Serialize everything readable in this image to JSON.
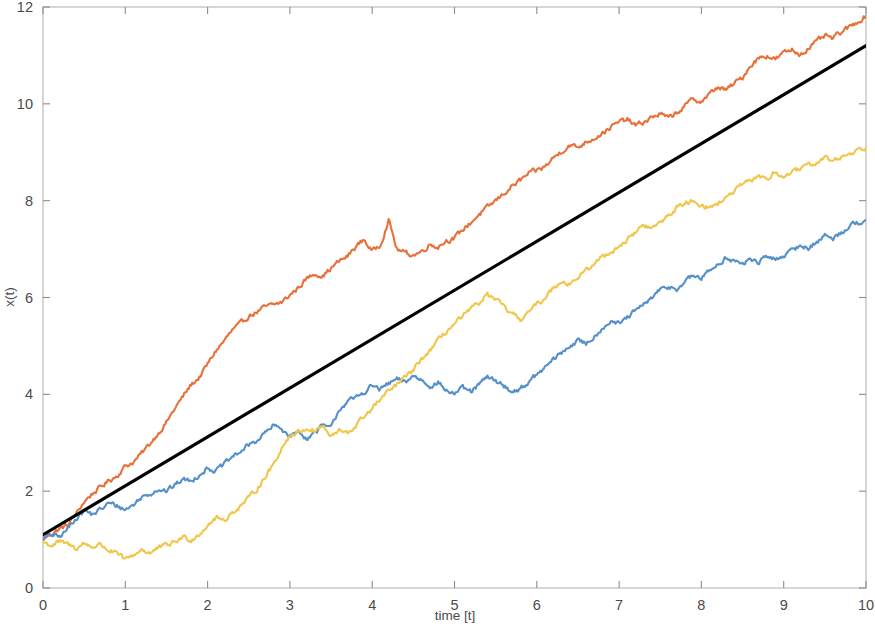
{
  "chart_data": {
    "type": "line",
    "title": "",
    "subtitle": "",
    "xlabel": "time [t]",
    "ylabel": "x(t)",
    "xlim": [
      0,
      10
    ],
    "ylim": [
      0,
      12
    ],
    "xticks": [
      0,
      1,
      2,
      3,
      4,
      5,
      6,
      7,
      8,
      9,
      10
    ],
    "yticks": [
      0,
      2,
      4,
      6,
      8,
      10,
      12
    ],
    "xtick_labels": [
      "0",
      "1",
      "2",
      "3",
      "4",
      "5",
      "6",
      "7",
      "8",
      "9",
      "10"
    ],
    "ytick_labels": [
      "0",
      "2",
      "4",
      "6",
      "8",
      "10",
      "12"
    ],
    "grid": false,
    "legend": null,
    "legend_position": "none",
    "background": "#ffffff",
    "frame_color": "#b4b4b4",
    "tick_color": "#8c8c8c",
    "label_color": "#4a4a4a",
    "annotations": [],
    "series": [
      {
        "name": "path-1-orange",
        "color": "#E8703A",
        "linewidth": 2.1,
        "style": "solid",
        "x": [
          0,
          0.1,
          0.2,
          0.3,
          0.4,
          0.5,
          0.6,
          0.7,
          0.8,
          0.9,
          1.0,
          1.1,
          1.2,
          1.3,
          1.4,
          1.5,
          1.6,
          1.7,
          1.8,
          1.9,
          2.0,
          2.1,
          2.2,
          2.3,
          2.4,
          2.5,
          2.6,
          2.7,
          2.8,
          2.9,
          3.0,
          3.1,
          3.2,
          3.3,
          3.4,
          3.5,
          3.6,
          3.7,
          3.8,
          3.9,
          4.0,
          4.1,
          4.2,
          4.3,
          4.4,
          4.5,
          4.6,
          4.7,
          4.8,
          4.9,
          5.0,
          5.1,
          5.2,
          5.3,
          5.4,
          5.5,
          5.6,
          5.7,
          5.8,
          5.9,
          6.0,
          6.1,
          6.2,
          6.3,
          6.4,
          6.5,
          6.6,
          6.7,
          6.8,
          6.9,
          7.0,
          7.1,
          7.2,
          7.3,
          7.4,
          7.5,
          7.6,
          7.7,
          7.8,
          7.9,
          8.0,
          8.1,
          8.2,
          8.3,
          8.4,
          8.5,
          8.6,
          8.7,
          8.8,
          8.9,
          9.0,
          9.1,
          9.2,
          9.3,
          9.4,
          9.5,
          9.6,
          9.7,
          9.8,
          9.9,
          10.0
        ],
        "y": [
          1.0,
          1.12,
          1.22,
          1.3,
          1.52,
          1.78,
          1.95,
          2.08,
          2.22,
          2.32,
          2.52,
          2.6,
          2.78,
          2.98,
          3.2,
          3.42,
          3.7,
          3.95,
          4.2,
          4.35,
          4.62,
          4.9,
          5.1,
          5.32,
          5.45,
          5.62,
          5.7,
          5.8,
          5.85,
          5.9,
          6.05,
          6.2,
          6.38,
          6.5,
          6.45,
          6.6,
          6.75,
          6.85,
          7.05,
          7.2,
          6.95,
          7.1,
          7.6,
          7.0,
          6.92,
          6.88,
          6.95,
          7.1,
          7.05,
          7.18,
          7.22,
          7.4,
          7.55,
          7.72,
          7.85,
          8.0,
          8.15,
          8.3,
          8.42,
          8.55,
          8.62,
          8.7,
          8.88,
          9.02,
          9.15,
          9.1,
          9.22,
          9.3,
          9.4,
          9.52,
          9.62,
          9.68,
          9.55,
          9.62,
          9.72,
          9.8,
          9.7,
          9.82,
          9.95,
          10.1,
          10.05,
          10.2,
          10.35,
          10.28,
          10.42,
          10.55,
          10.8,
          10.95,
          11.0,
          10.92,
          11.05,
          11.12,
          11.02,
          11.15,
          11.28,
          11.4,
          11.35,
          11.48,
          11.58,
          11.7,
          11.82
        ]
      },
      {
        "name": "path-2-blue",
        "color": "#5590C8",
        "linewidth": 2.1,
        "style": "solid",
        "x": [
          0,
          0.1,
          0.2,
          0.3,
          0.4,
          0.5,
          0.6,
          0.7,
          0.8,
          0.9,
          1.0,
          1.1,
          1.2,
          1.3,
          1.4,
          1.5,
          1.6,
          1.7,
          1.8,
          1.9,
          2.0,
          2.1,
          2.2,
          2.3,
          2.4,
          2.5,
          2.6,
          2.7,
          2.8,
          2.9,
          3.0,
          3.1,
          3.2,
          3.3,
          3.4,
          3.5,
          3.6,
          3.7,
          3.8,
          3.9,
          4.0,
          4.1,
          4.2,
          4.3,
          4.4,
          4.5,
          4.6,
          4.7,
          4.8,
          4.9,
          5.0,
          5.1,
          5.2,
          5.3,
          5.4,
          5.5,
          5.6,
          5.7,
          5.8,
          5.9,
          6.0,
          6.1,
          6.2,
          6.3,
          6.4,
          6.5,
          6.6,
          6.7,
          6.8,
          6.9,
          7.0,
          7.1,
          7.2,
          7.3,
          7.4,
          7.5,
          7.6,
          7.7,
          7.8,
          7.9,
          8.0,
          8.1,
          8.2,
          8.3,
          8.4,
          8.5,
          8.6,
          8.7,
          8.8,
          8.9,
          9.0,
          9.1,
          9.2,
          9.3,
          9.4,
          9.5,
          9.6,
          9.7,
          9.8,
          9.9,
          10.0
        ],
        "y": [
          1.02,
          1.1,
          1.05,
          1.22,
          1.45,
          1.6,
          1.52,
          1.62,
          1.75,
          1.7,
          1.62,
          1.72,
          1.88,
          1.95,
          2.05,
          2.0,
          2.12,
          2.25,
          2.2,
          2.35,
          2.48,
          2.42,
          2.55,
          2.7,
          2.82,
          2.95,
          3.05,
          3.2,
          3.35,
          3.28,
          3.15,
          3.22,
          3.1,
          3.2,
          3.35,
          3.3,
          3.7,
          3.85,
          3.92,
          4.05,
          4.18,
          4.1,
          4.22,
          4.3,
          4.25,
          4.38,
          4.3,
          4.18,
          4.25,
          4.08,
          4.02,
          4.12,
          4.05,
          4.2,
          4.35,
          4.28,
          4.18,
          4.05,
          4.12,
          4.25,
          4.4,
          4.55,
          4.72,
          4.85,
          5.0,
          5.1,
          5.05,
          5.2,
          5.38,
          5.52,
          5.45,
          5.58,
          5.72,
          5.85,
          6.0,
          6.15,
          6.22,
          6.18,
          6.32,
          6.45,
          6.4,
          6.55,
          6.7,
          6.82,
          6.75,
          6.68,
          6.8,
          6.72,
          6.85,
          6.78,
          6.88,
          6.95,
          7.08,
          7.02,
          7.15,
          7.28,
          7.22,
          7.35,
          7.48,
          7.55,
          7.6
        ]
      },
      {
        "name": "path-3-yellow",
        "color": "#F0C64B",
        "linewidth": 2.1,
        "style": "solid",
        "x": [
          0,
          0.1,
          0.2,
          0.3,
          0.4,
          0.5,
          0.6,
          0.7,
          0.8,
          0.9,
          1.0,
          1.1,
          1.2,
          1.3,
          1.4,
          1.5,
          1.6,
          1.7,
          1.8,
          1.9,
          2.0,
          2.1,
          2.2,
          2.3,
          2.4,
          2.5,
          2.6,
          2.7,
          2.8,
          2.9,
          3.0,
          3.1,
          3.2,
          3.3,
          3.4,
          3.5,
          3.6,
          3.7,
          3.8,
          3.9,
          4.0,
          4.1,
          4.2,
          4.3,
          4.4,
          4.5,
          4.6,
          4.7,
          4.8,
          4.9,
          5.0,
          5.1,
          5.2,
          5.3,
          5.4,
          5.5,
          5.6,
          5.7,
          5.8,
          5.9,
          6.0,
          6.1,
          6.2,
          6.3,
          6.4,
          6.5,
          6.6,
          6.7,
          6.8,
          6.9,
          7.0,
          7.1,
          7.2,
          7.3,
          7.4,
          7.5,
          7.6,
          7.7,
          7.8,
          7.9,
          8.0,
          8.1,
          8.2,
          8.3,
          8.4,
          8.5,
          8.6,
          8.7,
          8.8,
          8.9,
          9.0,
          9.1,
          9.2,
          9.3,
          9.4,
          9.5,
          9.6,
          9.7,
          9.8,
          9.9,
          10.0
        ],
        "y": [
          0.95,
          0.88,
          0.95,
          0.9,
          0.82,
          0.92,
          0.85,
          0.9,
          0.78,
          0.7,
          0.58,
          0.68,
          0.8,
          0.72,
          0.82,
          0.88,
          0.95,
          1.05,
          1.0,
          1.12,
          1.3,
          1.45,
          1.4,
          1.55,
          1.7,
          1.85,
          2.05,
          2.3,
          2.55,
          2.9,
          3.15,
          3.22,
          3.3,
          3.25,
          3.35,
          3.12,
          3.25,
          3.18,
          3.35,
          3.55,
          3.7,
          3.9,
          4.05,
          4.2,
          4.35,
          4.5,
          4.72,
          4.9,
          5.1,
          5.3,
          5.45,
          5.6,
          5.75,
          5.9,
          6.05,
          5.95,
          5.8,
          5.65,
          5.55,
          5.7,
          5.85,
          6.0,
          6.2,
          6.35,
          6.28,
          6.42,
          6.55,
          6.7,
          6.85,
          6.95,
          7.05,
          7.2,
          7.35,
          7.5,
          7.42,
          7.55,
          7.7,
          7.85,
          7.95,
          8.0,
          7.92,
          7.85,
          7.95,
          8.05,
          8.2,
          8.32,
          8.4,
          8.52,
          8.45,
          8.58,
          8.5,
          8.58,
          8.65,
          8.72,
          8.8,
          8.88,
          8.82,
          8.9,
          8.98,
          9.05,
          9.1
        ]
      },
      {
        "name": "mean-trend-black",
        "color": "#000000",
        "linewidth": 3.2,
        "style": "solid",
        "x": [
          0,
          10
        ],
        "y": [
          1.1,
          11.2
        ]
      }
    ]
  }
}
